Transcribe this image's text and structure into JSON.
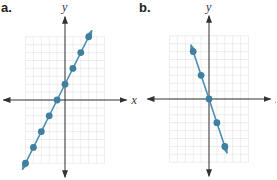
{
  "chart_data": [
    {
      "type": "line",
      "panel_label": "a.",
      "title": "",
      "xlabel": "x",
      "ylabel": "y",
      "equation_implied": "y = 2x + 2",
      "points": [
        {
          "x": -5,
          "y": -8
        },
        {
          "x": -4,
          "y": -6
        },
        {
          "x": -3,
          "y": -4
        },
        {
          "x": -2,
          "y": -2
        },
        {
          "x": -1,
          "y": 0
        },
        {
          "x": 0,
          "y": 2
        },
        {
          "x": 1,
          "y": 4
        },
        {
          "x": 2,
          "y": 6
        },
        {
          "x": 3,
          "y": 8
        }
      ],
      "xlim": [
        -5,
        5
      ],
      "ylim": [
        -8,
        8
      ],
      "grid": true,
      "tick_labels": false,
      "line_color": "#4a8fb0",
      "point_color": "#3f7f9f",
      "axis_color": "#333333",
      "grid_color": "#e2e2e2"
    },
    {
      "type": "line",
      "panel_label": "b.",
      "title": "",
      "xlabel": "x",
      "ylabel": "y",
      "equation_implied": "y = -3x",
      "points": [
        {
          "x": -2,
          "y": 6
        },
        {
          "x": -1,
          "y": 3
        },
        {
          "x": 0,
          "y": 0
        },
        {
          "x": 1,
          "y": -3
        },
        {
          "x": 2,
          "y": -6
        }
      ],
      "xlim": [
        -5,
        5
      ],
      "ylim": [
        -8,
        8
      ],
      "grid": true,
      "tick_labels": false,
      "line_color": "#4a8fb0",
      "point_color": "#3f7f9f",
      "axis_color": "#333333",
      "grid_color": "#e2e2e2"
    }
  ],
  "panels": [
    {
      "label": "a.",
      "xlabel": "x",
      "ylabel": "y"
    },
    {
      "label": "b.",
      "xlabel": "x",
      "ylabel": "y"
    }
  ]
}
